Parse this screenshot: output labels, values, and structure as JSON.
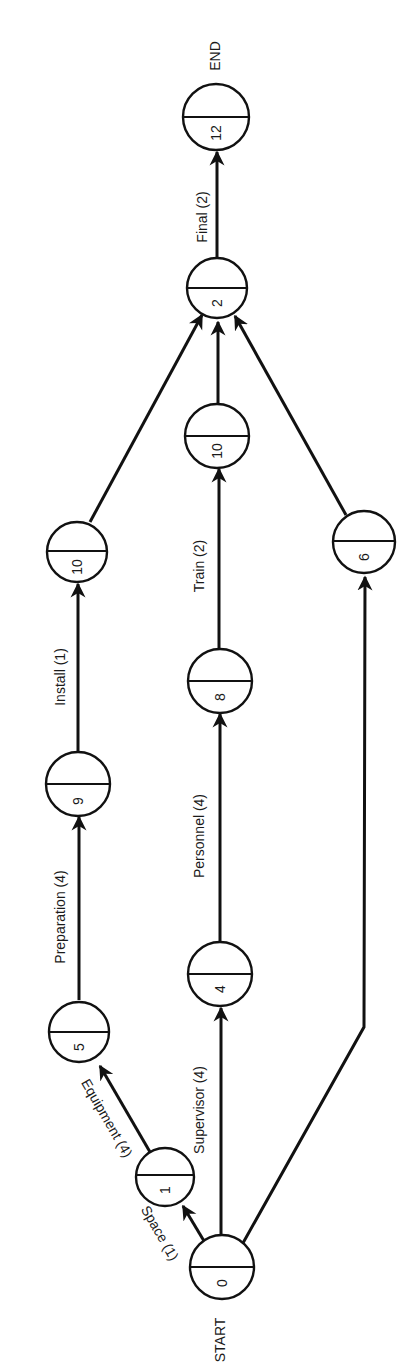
{
  "diagram": {
    "type": "activity-on-arrow network (PERT/CPM), rotated 90 degrees clockwise",
    "colors": {
      "line": "#111111",
      "background": "#ffffff"
    },
    "terminals": {
      "start_label": "START",
      "end_label": "END"
    },
    "nodes": [
      {
        "id": "n0",
        "value": "0",
        "role": "start"
      },
      {
        "id": "n1",
        "value": "1"
      },
      {
        "id": "n5",
        "value": "5"
      },
      {
        "id": "n9",
        "value": "9"
      },
      {
        "id": "n10a",
        "value": "10"
      },
      {
        "id": "n4",
        "value": "4"
      },
      {
        "id": "n8",
        "value": "8"
      },
      {
        "id": "n10b",
        "value": "10"
      },
      {
        "id": "n6",
        "value": "6"
      },
      {
        "id": "n2",
        "value": "2"
      },
      {
        "id": "n12",
        "value": "12",
        "role": "end"
      }
    ],
    "activities": [
      {
        "from": "n0",
        "to": "n1",
        "label": "Space (1)"
      },
      {
        "from": "n1",
        "to": "n5",
        "label": "Equipment (4)"
      },
      {
        "from": "n5",
        "to": "n9",
        "label": "Preparation (4)"
      },
      {
        "from": "n9",
        "to": "n10a",
        "label": "Install (1)"
      },
      {
        "from": "n10a",
        "to": "n2",
        "label": ""
      },
      {
        "from": "n0",
        "to": "n4",
        "label": "Supervisor (4)"
      },
      {
        "from": "n4",
        "to": "n8",
        "label": "Personnel (4)"
      },
      {
        "from": "n8",
        "to": "n10b",
        "label": "Train (2)"
      },
      {
        "from": "n10b",
        "to": "n2",
        "label": ""
      },
      {
        "from": "n0",
        "to": "n6",
        "label": ""
      },
      {
        "from": "n6",
        "to": "n2",
        "label": ""
      },
      {
        "from": "n2",
        "to": "n12",
        "label": "Final (2)"
      }
    ]
  }
}
